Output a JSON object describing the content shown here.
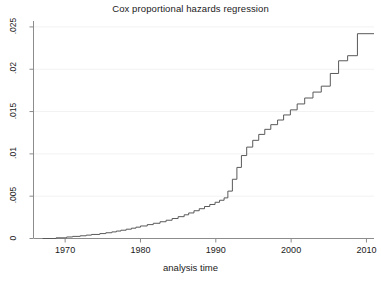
{
  "chart_data": {
    "type": "line",
    "subtype": "step-post",
    "title": "Cox proportional hazards regression",
    "xlabel": "analysis time",
    "ylabel": "",
    "xlim": [
      1965.8,
      2011.0
    ],
    "ylim": [
      0,
      0.0257
    ],
    "xticks": [
      1970,
      1980,
      1990,
      2000,
      2010
    ],
    "xtick_labels": [
      "1970",
      "1980",
      "1990",
      "2000",
      "2010"
    ],
    "yticks": [
      0,
      0.005,
      0.01,
      0.015,
      0.02,
      0.025
    ],
    "ytick_labels": [
      "0",
      ".005",
      ".01",
      ".015",
      ".02",
      ".025"
    ],
    "grid": true,
    "grid_axis": "y",
    "legend": null,
    "series_name": "cumulative hazard",
    "line_color": "#595959",
    "grid_color": "#f2f2f2",
    "axis_color": "#8c8c8c",
    "x": [
      1967.0,
      1968.8,
      1970.2,
      1971.0,
      1972.0,
      1972.8,
      1973.5,
      1974.6,
      1975.4,
      1976.2,
      1976.8,
      1977.4,
      1978.1,
      1978.8,
      1979.4,
      1980.0,
      1980.9,
      1981.7,
      1982.6,
      1983.4,
      1984.2,
      1985.0,
      1985.8,
      1986.4,
      1987.1,
      1987.8,
      1988.5,
      1989.2,
      1989.9,
      1990.5,
      1991.1,
      1991.6,
      1992.2,
      1992.8,
      1993.4,
      1994.1,
      1994.9,
      1995.7,
      1996.5,
      1997.3,
      1998.2,
      1999.0,
      1999.9,
      2000.8,
      2001.8,
      2002.9,
      2004.0,
      2005.2,
      2006.3,
      2007.5,
      2008.8,
      2011.0
    ],
    "y": [
      0.0,
      8e-05,
      0.00018,
      0.00025,
      0.00032,
      0.0004,
      0.00048,
      0.00058,
      0.00068,
      0.00078,
      0.00088,
      0.00098,
      0.0011,
      0.00122,
      0.00134,
      0.00148,
      0.00164,
      0.0018,
      0.00198,
      0.00216,
      0.00236,
      0.00258,
      0.0028,
      0.00302,
      0.00328,
      0.00352,
      0.00378,
      0.00402,
      0.00428,
      0.00452,
      0.0048,
      0.0056,
      0.007,
      0.0084,
      0.0098,
      0.0108,
      0.0116,
      0.0123,
      0.0129,
      0.01345,
      0.014,
      0.0146,
      0.0152,
      0.0159,
      0.0166,
      0.0173,
      0.018,
      0.0195,
      0.021,
      0.0216,
      0.0242,
      0.0242
    ]
  },
  "axis_labels": {
    "y": [
      ".025",
      ".02",
      ".015",
      ".01",
      ".005",
      "0"
    ],
    "x": [
      "1970",
      "1980",
      "1990",
      "2000",
      "2010"
    ]
  },
  "titles": {
    "main": "Cox proportional hazards regression",
    "x_axis": "analysis time"
  }
}
